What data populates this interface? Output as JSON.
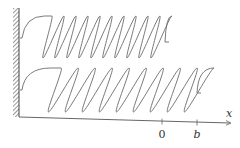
{
  "diagram": {
    "colors": {
      "stroke": "#6b6b6b",
      "wall_hatch": "#555555",
      "axis": "#666666",
      "text": "#333333"
    },
    "wall": {
      "x": 19,
      "y_top": 8,
      "y_bottom": 117
    },
    "springs": [
      {
        "name": "upper",
        "attach_y": 38,
        "loops": 10,
        "x_start": 37,
        "pitch": 12,
        "top": 16,
        "bottom": 58,
        "end_x": 168,
        "end_y": 42
      },
      {
        "name": "lower",
        "attach_y": 90,
        "loops": 9,
        "x_start": 40,
        "pitch": 17,
        "top": 68,
        "bottom": 112,
        "end_x": 200,
        "end_y": 93
      }
    ],
    "axis": {
      "label": "x",
      "ticks": [
        {
          "label": "0",
          "x": 162
        },
        {
          "label": "b",
          "x": 197
        }
      ]
    }
  }
}
